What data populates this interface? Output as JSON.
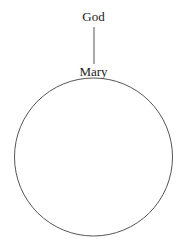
{
  "diagram": {
    "top_node": {
      "label": "God"
    },
    "bottom_node": {
      "label": "Mary"
    },
    "connector": {
      "type": "line",
      "from": "God",
      "to": "Mary"
    },
    "circle": {
      "shape": "circle",
      "attached_to": "Mary"
    },
    "colors": {
      "stroke": "#555555",
      "text": "#222222",
      "background": "#ffffff"
    }
  }
}
